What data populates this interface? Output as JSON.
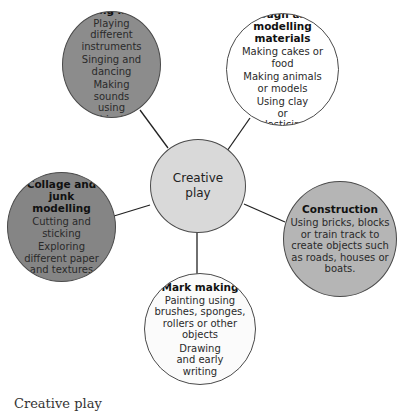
{
  "center": {
    "label_line1": "Creative",
    "label_line2": "play",
    "fill": "#d9d9d9"
  },
  "nodes": {
    "music": {
      "title": "Making music",
      "items": [
        "Playing different instruments",
        "Singing and dancing",
        "Making sounds using objects"
      ],
      "fill": "#8c8c8c"
    },
    "dough": {
      "title": "Dough and modelling materials",
      "items": [
        "Making cakes or food",
        "Making animals or models",
        "Using clay or plasticine"
      ],
      "fill": "#ffffff"
    },
    "collage": {
      "title": "Collage and junk modelling",
      "items": [
        "Cutting and sticking",
        "Exploring different paper and textures"
      ],
      "fill": "#858585"
    },
    "construction": {
      "title": "Construction",
      "items": [
        "Using bricks, blocks or train track to create objects such as roads, houses or boats."
      ],
      "fill": "#b5b5b5"
    },
    "mark": {
      "title": "Mark making",
      "items": [
        "Painting using brushes, sponges, rollers or other objects",
        "Drawing and early writing"
      ],
      "fill": "#fbfbfb"
    }
  },
  "caption": "Creative play"
}
